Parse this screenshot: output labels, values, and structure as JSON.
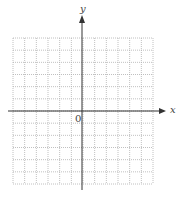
{
  "diagram": {
    "type": "coordinate-grid",
    "x_axis_label": "x",
    "y_axis_label": "y",
    "origin_label": "0",
    "grid": {
      "columns": 12,
      "rows": 12,
      "x_range": [
        -6,
        6
      ],
      "y_range": [
        -6,
        6
      ],
      "line_style": "dotted",
      "line_color": "#b0b0b0"
    },
    "axis_color": "#333333"
  }
}
